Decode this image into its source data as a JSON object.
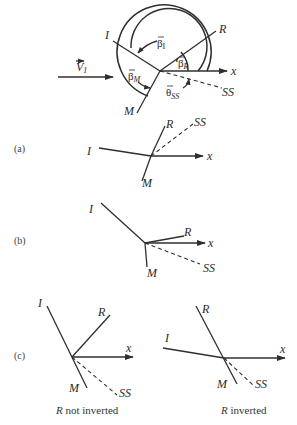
{
  "main_diagram": {
    "velocity_label": "V",
    "velocity_sub": "1",
    "lines": {
      "I": "I",
      "R": "R",
      "M": "M",
      "SS": "SS",
      "x": "x"
    },
    "angles": {
      "beta_I": "β",
      "beta_I_sub": "I",
      "beta_R": "β",
      "beta_R_sub": "R",
      "beta_M": "β",
      "beta_M_sub": "M",
      "theta_SS": "θ",
      "theta_SS_sub": "SS"
    }
  },
  "panels": {
    "a": {
      "label": "(a)",
      "I": "I",
      "R": "R",
      "M": "M",
      "SS": "SS",
      "x": "x"
    },
    "b": {
      "label": "(b)",
      "I": "I",
      "R": "R",
      "M": "M",
      "SS": "SS",
      "x": "x"
    },
    "c": {
      "label": "(c)",
      "left": {
        "I": "I",
        "R": "R",
        "M": "M",
        "SS": "SS",
        "x": "x",
        "caption_italic": "R",
        "caption_rest": " not inverted"
      },
      "right": {
        "I": "I",
        "R": "R",
        "M": "M",
        "SS": "SS",
        "x": "x",
        "caption_italic": "R",
        "caption_rest": " inverted"
      }
    }
  },
  "colors": {
    "line": "#2f2f2f",
    "background": "#ffffff"
  }
}
